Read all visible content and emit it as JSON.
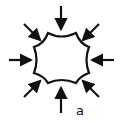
{
  "diagram": {
    "label": "a",
    "stroke_color": "#111111",
    "background": "#ffffff",
    "arrow_count": 8,
    "arrow_directions": [
      "top",
      "top-right",
      "right",
      "bottom-right",
      "bottom",
      "bottom-left",
      "left",
      "top-left"
    ]
  }
}
